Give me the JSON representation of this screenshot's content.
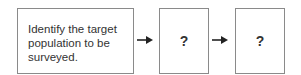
{
  "diagram": {
    "type": "flowchart",
    "steps": [
      {
        "label": "Identify the target population to be surveyed.",
        "lines": [
          "Identify the target",
          "population to be",
          "surveyed."
        ]
      },
      {
        "label": "?"
      },
      {
        "label": "?"
      }
    ],
    "connectors": [
      {
        "from": 0,
        "to": 1,
        "style": "arrow"
      },
      {
        "from": 1,
        "to": 2,
        "style": "arrow"
      }
    ],
    "colors": {
      "border": "#8a8a8a",
      "text": "#333333",
      "arrow": "#222222",
      "background": "#ffffff"
    }
  }
}
